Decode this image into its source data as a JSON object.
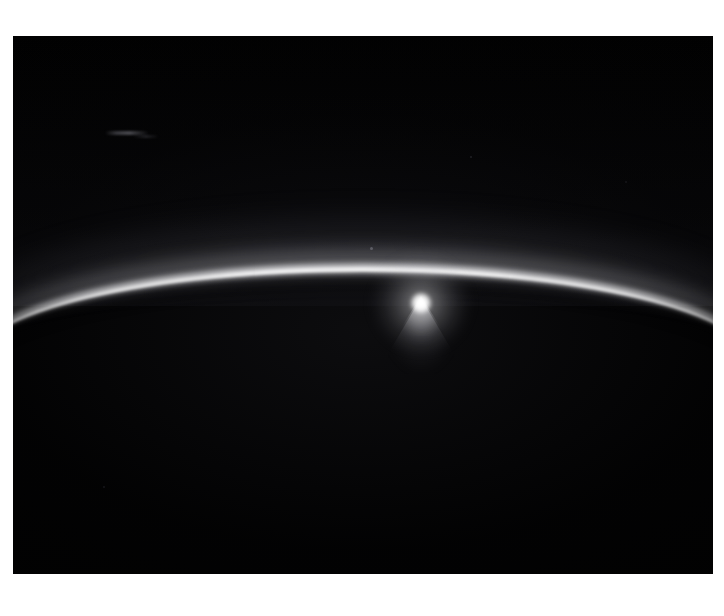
{
  "page": {
    "background_color": "#ffffff",
    "width": 724,
    "height": 616
  },
  "photograph": {
    "name": "bright-ring-arc-photograph",
    "frame": {
      "x": 13,
      "y": 36,
      "width": 700,
      "height": 538
    },
    "background_color": "#010101",
    "caption": "",
    "alt_text": "Dark space field crossed by a thin luminous arc with a single intense bright point and a downward plume of light",
    "colors": {
      "field": "#010101",
      "arc_core": "#f4f4f6",
      "arc_filament": "#ffffff",
      "arc_halo": "#9698a0",
      "bright_point": "#ffffff",
      "plume": "#e6e6ec"
    }
  },
  "features": {
    "arc": {
      "label": "luminous arc",
      "shape": "shallow upward arc spanning full image width",
      "left_edge_y": 312,
      "apex_x": 430,
      "apex_y": 295,
      "right_edge_y": 317,
      "core_thickness_px": 8,
      "halo_thickness_px": 44
    },
    "bright_point": {
      "label": "bright point source",
      "x": 421,
      "y": 303,
      "core_diameter_px": 20,
      "halo_diameter_px": 94
    },
    "plume": {
      "label": "downward light plume",
      "origin_x": 421,
      "origin_y": 306,
      "extent_px": 76,
      "direction": "downward fan"
    },
    "artifacts": [
      {
        "label": "faint horizontal streak",
        "x": 105,
        "y": 131,
        "width": 44,
        "height": 4
      },
      {
        "label": "faint horizontal streak",
        "x": 133,
        "y": 135,
        "width": 26,
        "height": 3
      },
      {
        "label": "faint field dot",
        "x": 370,
        "y": 247,
        "size": 3
      },
      {
        "label": "faint field dot",
        "x": 470,
        "y": 156,
        "size": 2
      },
      {
        "label": "faint field dot",
        "x": 103,
        "y": 486,
        "size": 2
      },
      {
        "label": "faint field dot",
        "x": 625,
        "y": 181,
        "size": 2
      }
    ]
  }
}
